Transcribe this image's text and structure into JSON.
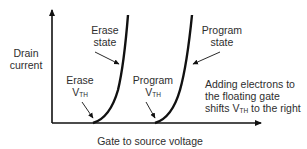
{
  "diagram": {
    "y_axis_label": [
      "Drain",
      "current"
    ],
    "x_axis_label": "Gate to source voltage",
    "curves": [
      {
        "name": "erase-state-curve",
        "label": [
          "Erase",
          "state"
        ]
      },
      {
        "name": "program-state-curve",
        "label": [
          "Program",
          "state"
        ]
      }
    ],
    "thresholds": [
      {
        "name": "erase-vth",
        "label_line1": "Erase",
        "v": "V",
        "sub": "TH"
      },
      {
        "name": "program-vth",
        "label_line1": "Program",
        "v": "V",
        "sub": "TH"
      }
    ],
    "annotation": {
      "line1": "Adding electrons to",
      "line2": "the floating gate",
      "line3_pre": "shifts V",
      "line3_sub": "TH",
      "line3_post": " to the right"
    },
    "colors": {
      "line": "#111111",
      "text": "#2e2e2e"
    }
  }
}
